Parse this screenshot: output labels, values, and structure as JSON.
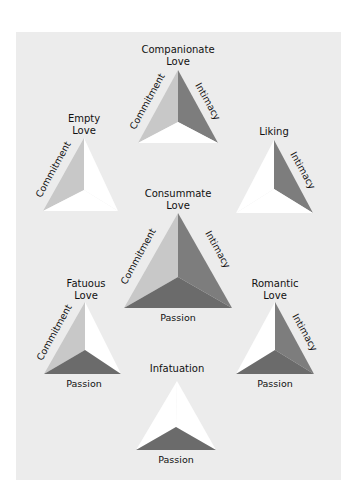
{
  "colors": {
    "panel_bg": "#ececec",
    "commitment_face": "#c8c8c8",
    "intimacy_face": "#7d7d7d",
    "passion_face": "#6b6b6b",
    "empty_face": "#ffffff"
  },
  "triangles": [
    {
      "id": "companionate",
      "title": [
        "Companionate",
        "Love"
      ],
      "labels": {
        "commitment": "Commitment",
        "intimacy": "Intimacy"
      },
      "components": {
        "commitment": true,
        "intimacy": true,
        "passion": false
      }
    },
    {
      "id": "empty",
      "title": [
        "Empty",
        "Love"
      ],
      "labels": {
        "commitment": "Commitment"
      },
      "components": {
        "commitment": true,
        "intimacy": false,
        "passion": false
      }
    },
    {
      "id": "liking",
      "title": [
        "Liking"
      ],
      "labels": {
        "intimacy": "Intimacy"
      },
      "components": {
        "commitment": false,
        "intimacy": true,
        "passion": false
      }
    },
    {
      "id": "consummate",
      "title": [
        "Consummate",
        "Love"
      ],
      "labels": {
        "commitment": "Commitment",
        "intimacy": "Intimacy",
        "passion": "Passion"
      },
      "components": {
        "commitment": true,
        "intimacy": true,
        "passion": true
      }
    },
    {
      "id": "fatuous",
      "title": [
        "Fatuous",
        "Love"
      ],
      "labels": {
        "commitment": "Commitment",
        "passion": "Passion"
      },
      "components": {
        "commitment": true,
        "intimacy": false,
        "passion": true
      }
    },
    {
      "id": "romantic",
      "title": [
        "Romantic",
        "Love"
      ],
      "labels": {
        "intimacy": "Intimacy",
        "passion": "Passion"
      },
      "components": {
        "commitment": false,
        "intimacy": true,
        "passion": true
      }
    },
    {
      "id": "infatuation",
      "title": [
        "Infatuation"
      ],
      "labels": {
        "passion": "Passion"
      },
      "components": {
        "commitment": false,
        "intimacy": false,
        "passion": true
      }
    }
  ]
}
